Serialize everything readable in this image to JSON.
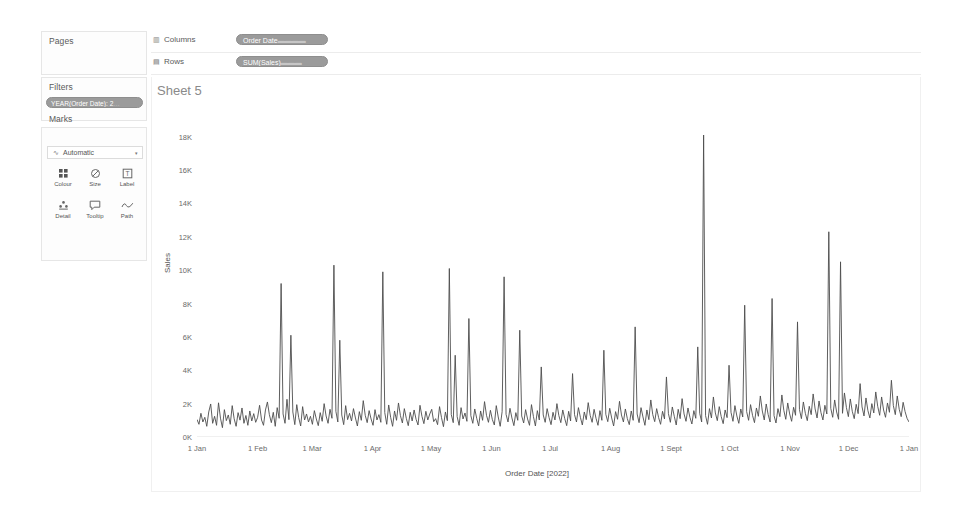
{
  "left_panel": {
    "pages": {
      "title": "Pages"
    },
    "filters": {
      "title": "Filters",
      "pill_label": "YEAR(Order Date): 2",
      "pill_trail": "…"
    },
    "marks": {
      "title": "Marks",
      "mark_type": "Automatic",
      "mark_type_glyph": "∿",
      "caret": "▾",
      "buttons": [
        {
          "name": "colour",
          "label": "Colour",
          "glyph": "⠿"
        },
        {
          "name": "size",
          "label": "Size",
          "glyph": "◔"
        },
        {
          "name": "label",
          "label": "Label",
          "glyph": "⊡"
        },
        {
          "name": "detail",
          "label": "Detail",
          "glyph": "⁂"
        },
        {
          "name": "tooltip",
          "label": "Tooltip",
          "glyph": "💬"
        },
        {
          "name": "path",
          "label": "Path",
          "glyph": "∿"
        }
      ]
    }
  },
  "shelves": {
    "columns": {
      "label": "Columns",
      "icon": "▥",
      "pill_label": "Order Date",
      "pill_trail": "▬▬▬▬"
    },
    "rows": {
      "label": "Rows",
      "icon": "▤",
      "pill_label": "SUM(Sales)",
      "pill_trail": "▬▬▬"
    }
  },
  "viz": {
    "sheet_title": "Sheet 5"
  },
  "chart_data": {
    "type": "line",
    "title": "Sheet 5",
    "xlabel": "Order Date [2022]",
    "ylabel": "Sales",
    "ylim": [
      0,
      19000
    ],
    "ytick_labels": [
      "0K",
      "2K",
      "4K",
      "6K",
      "8K",
      "10K",
      "12K",
      "14K",
      "16K",
      "18K"
    ],
    "ytick_values": [
      0,
      2000,
      4000,
      6000,
      8000,
      10000,
      12000,
      14000,
      16000,
      18000
    ],
    "xtick_labels": [
      "1 Jan",
      "1 Feb",
      "1 Mar",
      "1 Apr",
      "1 May",
      "1 Jun",
      "1 Jul",
      "1 Aug",
      "1 Sept",
      "1 Oct",
      "1 Nov",
      "1 Dec",
      "1 Jan"
    ],
    "xtick_days": [
      0,
      31,
      59,
      90,
      120,
      151,
      181,
      212,
      243,
      273,
      304,
      334,
      365
    ],
    "grid": false,
    "legend": "none",
    "series": [
      {
        "name": "SUM(Sales)",
        "color": "#4d4d4d",
        "values": [
          1050,
          760,
          1420,
          900,
          1180,
          640,
          1500,
          1980,
          820,
          1240,
          700,
          2050,
          1130,
          560,
          1640,
          980,
          1320,
          760,
          1880,
          1090,
          640,
          1460,
          1010,
          1740,
          820,
          1290,
          700,
          1560,
          960,
          1400,
          880,
          1180,
          1900,
          1020,
          700,
          1620,
          2100,
          1340,
          860,
          1480,
          640,
          1760,
          1120,
          9200,
          1380,
          820,
          2260,
          1040,
          6100,
          1500,
          740,
          1940,
          1160,
          660,
          1820,
          1020,
          1380,
          900,
          1240,
          760,
          1580,
          1080,
          680,
          1460,
          940,
          2000,
          1260,
          820,
          1660,
          1120,
          10300,
          1540,
          900,
          5800,
          1320,
          740,
          1880,
          1040,
          1420,
          960,
          1700,
          1140,
          660,
          1520,
          1000,
          2180,
          1300,
          860,
          1580,
          1080,
          700,
          1640,
          1020,
          1340,
          880,
          9900,
          1460,
          760,
          1920,
          1180,
          640,
          1560,
          1000,
          2040,
          1280,
          840,
          1700,
          1120,
          680,
          1480,
          960,
          1620,
          1060,
          720,
          1900,
          1240,
          800,
          1540,
          1020,
          1380,
          1660,
          920,
          1100,
          740,
          1820,
          1160,
          620,
          1500,
          980,
          10100,
          1340,
          860,
          4900,
          1220,
          700,
          1760,
          1080,
          1440,
          940,
          7100,
          1280,
          820,
          1680,
          1120,
          660,
          1560,
          1000,
          2120,
          1300,
          880,
          1600,
          1040,
          720,
          1880,
          1200,
          640,
          1520,
          9600,
          1360,
          900,
          1720,
          1140,
          680,
          1460,
          1000,
          6400,
          1260,
          840,
          1640,
          1080,
          700,
          1940,
          1220,
          660,
          1580,
          1020,
          4200,
          1320,
          880,
          1700,
          1160,
          740,
          1480,
          1020,
          2000,
          1280,
          860,
          1620,
          1100,
          680,
          1540,
          960,
          3800,
          1340,
          900,
          1760,
          1180,
          720,
          1500,
          1040,
          2060,
          1300,
          880,
          1660,
          1120,
          700,
          1580,
          1000,
          5200,
          1360,
          920,
          1720,
          1140,
          660,
          1520,
          1060,
          2140,
          1320,
          900,
          1680,
          1100,
          740,
          1560,
          1000,
          6600,
          1380,
          860,
          1760,
          1200,
          700,
          1620,
          1040,
          2220,
          1340,
          920,
          1700,
          1160,
          760,
          1540,
          1080,
          3600,
          1400,
          880,
          1800,
          1240,
          720,
          1660,
          1100,
          2300,
          1380,
          940,
          1740,
          1180,
          780,
          1580,
          1120,
          5400,
          1420,
          900,
          18100,
          1280,
          760,
          1700,
          1140,
          2400,
          1440,
          980,
          1820,
          1220,
          800,
          1620,
          1160,
          4300,
          1480,
          940,
          1880,
          1260,
          820,
          1680,
          1200,
          7900,
          1520,
          1000,
          1940,
          1300,
          860,
          1740,
          1240,
          2460,
          1560,
          1020,
          1980,
          1340,
          900,
          8300,
          1280,
          840,
          1700,
          1220,
          2520,
          1600,
          1060,
          2040,
          1380,
          940,
          1780,
          1300,
          6900,
          1640,
          1100,
          2100,
          1420,
          980,
          1840,
          1340,
          2580,
          1680,
          1140,
          2160,
          1460,
          1020,
          1900,
          1380,
          12300,
          1720,
          1180,
          2220,
          1500,
          1060,
          10500,
          1420,
          2640,
          1760,
          1220,
          2280,
          1540,
          1100,
          1960,
          1400,
          3200,
          1800,
          1260,
          2340,
          1580,
          1140,
          2000,
          1440,
          2700,
          1840,
          1300,
          2400,
          1620,
          1180,
          2040,
          1480,
          3400,
          1880,
          1340,
          2460,
          1660,
          1220,
          2080,
          1520,
          1120,
          900
        ]
      }
    ]
  }
}
